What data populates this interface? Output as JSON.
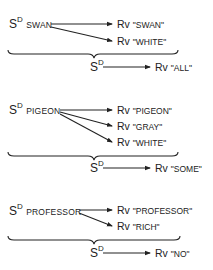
{
  "diagram": {
    "title": "",
    "groups": [
      {
        "stimulus": {
          "base": "S",
          "superscript": "D",
          "label": "SWAN"
        },
        "responses": [
          {
            "prefix": "Rv",
            "word": "\"SWAN\""
          },
          {
            "prefix": "Rv",
            "word": "\"WHITE\""
          }
        ],
        "combined": {
          "base": "S",
          "superscript": "D",
          "response_prefix": "Rv",
          "response_word": "\"ALL\""
        }
      },
      {
        "stimulus": {
          "base": "S",
          "superscript": "D",
          "label": "PIGEON"
        },
        "responses": [
          {
            "prefix": "Rv",
            "word": "\"PIGEON\""
          },
          {
            "prefix": "Rv",
            "word": "\"GRAY\""
          },
          {
            "prefix": "Rv",
            "word": "\"WHITE\""
          }
        ],
        "combined": {
          "base": "S",
          "superscript": "D",
          "response_prefix": "Rv",
          "response_word": "\"SOME\""
        }
      },
      {
        "stimulus": {
          "base": "S",
          "superscript": "D",
          "label": "PROFESSOR"
        },
        "responses": [
          {
            "prefix": "Rv",
            "word": "\"PROFESSOR\""
          },
          {
            "prefix": "Rv",
            "word": "\"RICH\""
          }
        ],
        "combined": {
          "base": "S",
          "superscript": "D",
          "response_prefix": "Rv",
          "response_word": "\"NO\""
        }
      }
    ],
    "colors": {
      "ink": "#222222",
      "background": "#ffffff"
    }
  }
}
